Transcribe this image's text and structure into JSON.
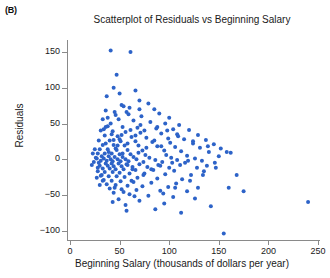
{
  "panel": {
    "label": "(B)"
  },
  "chart_data": {
    "type": "scatter",
    "title": "Scatterplot of Residuals vs Beginning Salary",
    "xlabel": "Beginning Salary (thousands of dollars per year)",
    "ylabel": "Residuals",
    "xlim": [
      -10,
      260
    ],
    "ylim": [
      -120,
      170
    ],
    "xticks": [
      0,
      50,
      100,
      150,
      200,
      250
    ],
    "yticks": [
      -100,
      -50,
      0,
      50,
      100,
      150
    ],
    "grid": false,
    "legend": null,
    "marker_color": "#2d63c8",
    "marker_size": 3,
    "points": [
      [
        41,
        152
      ],
      [
        61,
        150
      ],
      [
        47,
        118
      ],
      [
        44,
        100
      ],
      [
        66,
        96
      ],
      [
        70,
        82
      ],
      [
        79,
        78
      ],
      [
        52,
        76
      ],
      [
        60,
        72
      ],
      [
        85,
        70
      ],
      [
        36,
        68
      ],
      [
        57,
        66
      ],
      [
        90,
        64
      ],
      [
        46,
        62
      ],
      [
        72,
        60
      ],
      [
        100,
        58
      ],
      [
        33,
        56
      ],
      [
        64,
        54
      ],
      [
        81,
        52
      ],
      [
        96,
        50
      ],
      [
        110,
        48
      ],
      [
        38,
        46
      ],
      [
        53,
        45
      ],
      [
        68,
        44
      ],
      [
        87,
        43
      ],
      [
        104,
        42
      ],
      [
        120,
        41
      ],
      [
        31,
        40
      ],
      [
        43,
        39
      ],
      [
        56,
        38
      ],
      [
        71,
        37
      ],
      [
        92,
        36
      ],
      [
        108,
        35
      ],
      [
        129,
        34
      ],
      [
        35,
        33
      ],
      [
        48,
        32
      ],
      [
        62,
        31
      ],
      [
        77,
        30
      ],
      [
        99,
        29
      ],
      [
        115,
        28
      ],
      [
        137,
        27
      ],
      [
        29,
        26
      ],
      [
        40,
        26
      ],
      [
        51,
        25
      ],
      [
        66,
        25
      ],
      [
        83,
        24
      ],
      [
        101,
        23
      ],
      [
        124,
        22
      ],
      [
        145,
        21
      ],
      [
        33,
        20
      ],
      [
        44,
        20
      ],
      [
        55,
        19
      ],
      [
        69,
        19
      ],
      [
        88,
        18
      ],
      [
        106,
        17
      ],
      [
        131,
        16
      ],
      [
        152,
        15
      ],
      [
        30,
        14
      ],
      [
        38,
        14
      ],
      [
        47,
        13
      ],
      [
        58,
        13
      ],
      [
        73,
        12
      ],
      [
        95,
        12
      ],
      [
        112,
        11
      ],
      [
        140,
        10
      ],
      [
        162,
        9
      ],
      [
        28,
        8
      ],
      [
        35,
        8
      ],
      [
        42,
        8
      ],
      [
        50,
        7
      ],
      [
        61,
        7
      ],
      [
        76,
        6
      ],
      [
        97,
        6
      ],
      [
        118,
        5
      ],
      [
        150,
        4
      ],
      [
        32,
        4
      ],
      [
        39,
        4
      ],
      [
        45,
        3
      ],
      [
        53,
        3
      ],
      [
        64,
        3
      ],
      [
        80,
        2
      ],
      [
        102,
        2
      ],
      [
        126,
        1
      ],
      [
        27,
        1
      ],
      [
        34,
        1
      ],
      [
        41,
        0
      ],
      [
        48,
        0
      ],
      [
        56,
        0
      ],
      [
        67,
        0
      ],
      [
        86,
        -1
      ],
      [
        108,
        -1
      ],
      [
        133,
        -2
      ],
      [
        31,
        -2
      ],
      [
        37,
        -2
      ],
      [
        43,
        -3
      ],
      [
        51,
        -3
      ],
      [
        59,
        -3
      ],
      [
        74,
        -4
      ],
      [
        93,
        -4
      ],
      [
        116,
        -5
      ],
      [
        146,
        -5
      ],
      [
        29,
        -5
      ],
      [
        36,
        -6
      ],
      [
        42,
        -6
      ],
      [
        49,
        -6
      ],
      [
        57,
        -7
      ],
      [
        70,
        -7
      ],
      [
        89,
        -8
      ],
      [
        111,
        -8
      ],
      [
        138,
        -9
      ],
      [
        30,
        -9
      ],
      [
        38,
        -9
      ],
      [
        44,
        -10
      ],
      [
        52,
        -10
      ],
      [
        63,
        -11
      ],
      [
        78,
        -11
      ],
      [
        100,
        -12
      ],
      [
        128,
        -12
      ],
      [
        33,
        -13
      ],
      [
        40,
        -13
      ],
      [
        46,
        -14
      ],
      [
        54,
        -14
      ],
      [
        66,
        -15
      ],
      [
        84,
        -15
      ],
      [
        105,
        -16
      ],
      [
        135,
        -17
      ],
      [
        28,
        -17
      ],
      [
        35,
        -18
      ],
      [
        43,
        -18
      ],
      [
        50,
        -19
      ],
      [
        60,
        -20
      ],
      [
        75,
        -20
      ],
      [
        96,
        -21
      ],
      [
        122,
        -22
      ],
      [
        31,
        -23
      ],
      [
        39,
        -24
      ],
      [
        47,
        -24
      ],
      [
        55,
        -25
      ],
      [
        68,
        -26
      ],
      [
        88,
        -27
      ],
      [
        113,
        -28
      ],
      [
        34,
        -29
      ],
      [
        42,
        -30
      ],
      [
        51,
        -31
      ],
      [
        64,
        -32
      ],
      [
        82,
        -33
      ],
      [
        107,
        -34
      ],
      [
        37,
        -35
      ],
      [
        46,
        -36
      ],
      [
        58,
        -37
      ],
      [
        73,
        -38
      ],
      [
        99,
        -39
      ],
      [
        129,
        -40
      ],
      [
        40,
        -41
      ],
      [
        52,
        -42
      ],
      [
        67,
        -43
      ],
      [
        91,
        -44
      ],
      [
        118,
        -45
      ],
      [
        175,
        -45
      ],
      [
        44,
        -47
      ],
      [
        60,
        -49
      ],
      [
        79,
        -51
      ],
      [
        104,
        -53
      ],
      [
        240,
        -60
      ],
      [
        49,
        -56
      ],
      [
        70,
        -58
      ],
      [
        95,
        -62
      ],
      [
        142,
        -66
      ],
      [
        56,
        -64
      ],
      [
        86,
        -70
      ],
      [
        112,
        -75
      ],
      [
        155,
        -104
      ],
      [
        62,
        -30
      ],
      [
        74,
        -22
      ],
      [
        82,
        -14
      ],
      [
        91,
        -9
      ],
      [
        103,
        -5
      ],
      [
        119,
        -2
      ],
      [
        36,
        45
      ],
      [
        42,
        35
      ],
      [
        50,
        28
      ],
      [
        58,
        22
      ],
      [
        46,
        15
      ],
      [
        39,
        10
      ],
      [
        33,
        -30
      ],
      [
        30,
        -36
      ],
      [
        45,
        -40
      ],
      [
        54,
        -46
      ],
      [
        65,
        -52
      ],
      [
        36,
        22
      ],
      [
        44,
        27
      ],
      [
        52,
        34
      ],
      [
        61,
        41
      ],
      [
        71,
        48
      ],
      [
        34,
        42
      ],
      [
        41,
        50
      ],
      [
        49,
        56
      ],
      [
        59,
        63
      ],
      [
        70,
        70
      ],
      [
        38,
        58
      ],
      [
        45,
        66
      ],
      [
        54,
        74
      ],
      [
        32,
        -22
      ],
      [
        28,
        -12
      ],
      [
        26,
        2
      ],
      [
        25,
        14
      ],
      [
        27,
        -26
      ],
      [
        24,
        -4
      ],
      [
        23,
        8
      ],
      [
        22,
        -8
      ],
      [
        37,
        88
      ],
      [
        50,
        92
      ],
      [
        43,
        -60
      ],
      [
        57,
        -72
      ],
      [
        92,
        18
      ],
      [
        85,
        26
      ],
      [
        77,
        16
      ],
      [
        69,
        9
      ],
      [
        63,
        -14
      ],
      [
        58,
        -8
      ],
      [
        53,
        8
      ],
      [
        48,
        19
      ],
      [
        66,
        33
      ],
      [
        75,
        40
      ],
      [
        88,
        45
      ],
      [
        98,
        40
      ],
      [
        109,
        32
      ],
      [
        124,
        25
      ],
      [
        139,
        18
      ],
      [
        158,
        10
      ],
      [
        147,
        -12
      ],
      [
        134,
        -22
      ],
      [
        121,
        -30
      ],
      [
        106,
        -40
      ],
      [
        94,
        -48
      ],
      [
        126,
        -55
      ],
      [
        160,
        -40
      ],
      [
        168,
        -22
      ]
    ]
  }
}
